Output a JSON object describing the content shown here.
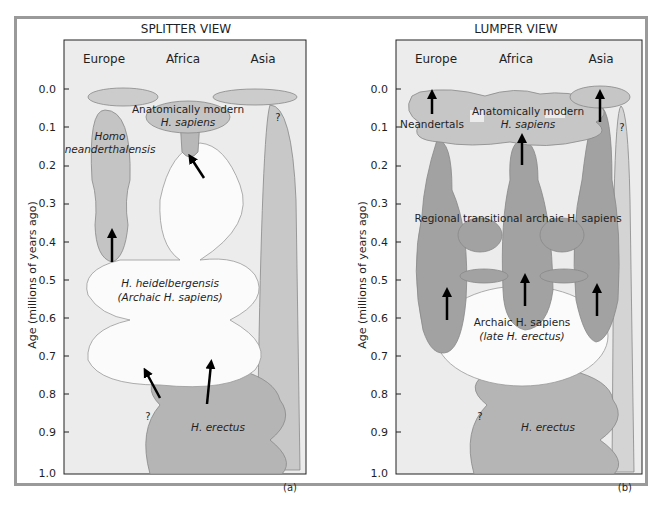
{
  "panels": [
    {
      "id": "a",
      "title": "SPLITTER VIEW",
      "label": "(a)",
      "regions": [
        "Europe",
        "Africa",
        "Asia"
      ],
      "labels": {
        "modern_1": "Anatomically modern",
        "modern_2": "H. sapiens",
        "neander_1": "Homo",
        "neander_2": "neanderthalensis",
        "heidel_1": "H. heidelbergensis",
        "heidel_2": "(Archaic H. sapiens)",
        "erectus": "H. erectus",
        "q1": "?",
        "q2": "?"
      }
    },
    {
      "id": "b",
      "title": "LUMPER VIEW",
      "label": "(b)",
      "regions": [
        "Europe",
        "Africa",
        "Asia"
      ],
      "labels": {
        "neandertals": "Neandertals",
        "modern_1": "Anatomically modern",
        "modern_2": "H. sapiens",
        "regional": "Regional transitional archaic H. sapiens",
        "archaic_1": "Archaic H. sapiens",
        "archaic_2": "(late H. erectus)",
        "erectus": "H. erectus",
        "q1": "?",
        "q2": "?"
      }
    }
  ],
  "axis": {
    "ylabel": "Age (millions of years ago)",
    "ticks": [
      "0.0",
      "0.1",
      "0.2",
      "0.3",
      "0.4",
      "0.5",
      "0.6",
      "0.7",
      "0.8",
      "0.9",
      "1.0"
    ]
  },
  "colors": {
    "plot_bg": "#ececec",
    "light_fill": "#d2d2d2",
    "mid_fill": "#b8b8b8",
    "dark_fill": "#9c9c9c",
    "white_fill": "#fbfbfb",
    "frame": "#9a9a9a",
    "arrow": "#000000"
  }
}
